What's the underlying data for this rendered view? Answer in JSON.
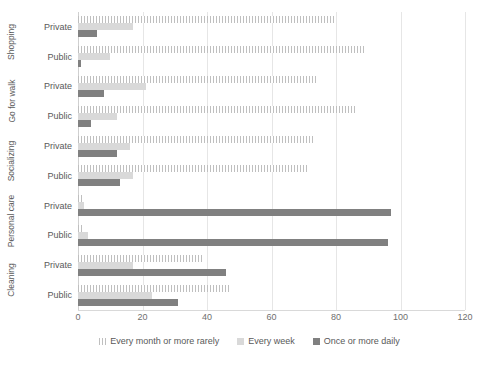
{
  "chart_data": {
    "type": "bar",
    "orientation": "horizontal",
    "title": "",
    "subtitle": "",
    "xlabel": "",
    "ylabel": "",
    "xlim": [
      0,
      120
    ],
    "xticks": [
      0,
      20,
      40,
      60,
      80,
      100,
      120
    ],
    "xtick_labels": [
      "0",
      "20",
      "40",
      "60",
      "80",
      "100",
      "120"
    ],
    "grid": true,
    "grid_axis": "x",
    "legend_position": "bottom",
    "legend": [
      "Every month or more rarely",
      "Every week",
      "Once or more daily"
    ],
    "group_labels": [
      "Shopping",
      "Go for walk",
      "Socializing",
      "Personal care",
      "Cleaning"
    ],
    "subgroup_labels": [
      "Private",
      "Public"
    ],
    "categories": [
      "Shopping – Private",
      "Shopping – Public",
      "Go for walk – Private",
      "Go for walk – Public",
      "Socializing – Private",
      "Socializing – Public",
      "Personal care – Private",
      "Personal care – Public",
      "Cleaning – Private",
      "Cleaning – Public"
    ],
    "series": [
      {
        "name": "Every month or more rarely",
        "color": "#f2f2f2",
        "pattern": "vertical-hatch",
        "values": [
          80,
          89,
          74,
          86,
          73,
          71,
          2,
          2,
          39,
          47
        ]
      },
      {
        "name": "Every week",
        "color": "#d9d9d9",
        "pattern": "solid",
        "values": [
          17,
          10,
          21,
          12,
          16,
          17,
          2,
          3,
          17,
          23
        ]
      },
      {
        "name": "Once or more daily",
        "color": "#808080",
        "pattern": "solid",
        "values": [
          6,
          1,
          8,
          4,
          12,
          13,
          97,
          96,
          46,
          31
        ]
      }
    ],
    "groups": [
      {
        "label": "Shopping",
        "rows": [
          {
            "label": "Private",
            "rarely": 80,
            "weekly": 17,
            "daily": 6
          },
          {
            "label": "Public",
            "rarely": 89,
            "weekly": 10,
            "daily": 1
          }
        ]
      },
      {
        "label": "Go for walk",
        "rows": [
          {
            "label": "Private",
            "rarely": 74,
            "weekly": 21,
            "daily": 8
          },
          {
            "label": "Public",
            "rarely": 86,
            "weekly": 12,
            "daily": 4
          }
        ]
      },
      {
        "label": "Socializing",
        "rows": [
          {
            "label": "Private",
            "rarely": 73,
            "weekly": 16,
            "daily": 12
          },
          {
            "label": "Public",
            "rarely": 71,
            "weekly": 17,
            "daily": 13
          }
        ]
      },
      {
        "label": "Personal care",
        "rows": [
          {
            "label": "Private",
            "rarely": 2,
            "weekly": 2,
            "daily": 97
          },
          {
            "label": "Public",
            "rarely": 2,
            "weekly": 3,
            "daily": 96
          }
        ]
      },
      {
        "label": "Cleaning",
        "rows": [
          {
            "label": "Private",
            "rarely": 39,
            "weekly": 17,
            "daily": 46
          },
          {
            "label": "Public",
            "rarely": 47,
            "weekly": 23,
            "daily": 31
          }
        ]
      }
    ]
  },
  "colors": {
    "rarely": "#f2f2f2",
    "rarely_hatch": "#bfbfbf",
    "weekly": "#d9d9d9",
    "daily": "#808080",
    "gridline": "#e6e6e6",
    "text": "#595959"
  }
}
